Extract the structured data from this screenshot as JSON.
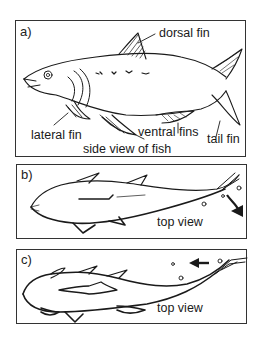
{
  "panels": [
    {
      "id": "a",
      "letter": "a)",
      "caption": "side view of fish",
      "labels": {
        "dorsal_fin": "dorsal fin",
        "lateral_fin": "lateral fin",
        "ventral_fins": "ventral fins",
        "tail_fin": "tail fin"
      }
    },
    {
      "id": "b",
      "letter": "b)",
      "caption": "top view",
      "arrow_direction": "down-right (tail sweeping)"
    },
    {
      "id": "c",
      "letter": "c)",
      "caption": "top view",
      "arrow_direction": "left (water pushed)"
    }
  ],
  "colors": {
    "ink": "#1a1a1a",
    "border": "#333333",
    "background": "#ffffff"
  }
}
